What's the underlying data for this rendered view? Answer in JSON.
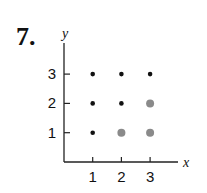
{
  "problem_number": "7.",
  "chart_data": {
    "type": "scatter",
    "title": "",
    "xlabel": "x",
    "ylabel": "y",
    "xticks": [
      "1",
      "2",
      "3"
    ],
    "yticks": [
      "1",
      "2",
      "3"
    ],
    "xlim": [
      0,
      4
    ],
    "ylim": [
      0,
      4
    ],
    "grid": false,
    "series": [
      {
        "name": "black points",
        "color": "#111111",
        "points": [
          [
            1,
            1
          ],
          [
            1,
            2
          ],
          [
            1,
            3
          ],
          [
            2,
            2
          ],
          [
            2,
            3
          ],
          [
            3,
            3
          ]
        ]
      },
      {
        "name": "gray points",
        "color": "#8a8a8a",
        "points": [
          [
            2,
            1
          ],
          [
            3,
            1
          ],
          [
            3,
            2
          ]
        ]
      }
    ]
  }
}
